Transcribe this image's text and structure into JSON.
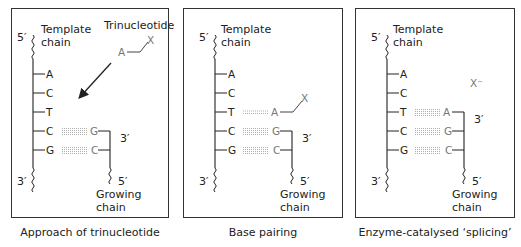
{
  "figure": {
    "panels": [
      {
        "id": "approach",
        "caption": "Approach of trinucleotide",
        "template_label_line1": "Template",
        "template_label_line2": "chain",
        "template_5prime": "5′",
        "template_3prime": "3′",
        "template_bases": [
          "A",
          "C",
          "T",
          "C",
          "G"
        ],
        "growing_bases": [
          "G",
          "C"
        ],
        "growing_3prime": "3′",
        "growing_5prime": "5′",
        "growing_label_line1": "Growing",
        "growing_label_line2": "chain",
        "trinucleotide_label": "Trinucleotide",
        "incoming_base": "A",
        "incoming_group": "X"
      },
      {
        "id": "base-pairing",
        "caption": "Base pairing",
        "template_label_line1": "Template",
        "template_label_line2": "chain",
        "template_5prime": "5′",
        "template_3prime": "3′",
        "template_bases": [
          "A",
          "C",
          "T",
          "C",
          "G"
        ],
        "growing_bases": [
          "A",
          "G",
          "C"
        ],
        "growing_3prime": "3′",
        "growing_5prime": "5′",
        "growing_label_line1": "Growing",
        "growing_label_line2": "chain",
        "incoming_group": "X"
      },
      {
        "id": "splicing",
        "caption": "Enzyme-catalysed ‘splicing’",
        "template_label_line1": "Template",
        "template_label_line2": "chain",
        "template_5prime": "5′",
        "template_3prime": "3′",
        "template_bases": [
          "A",
          "C",
          "T",
          "C",
          "G"
        ],
        "growing_bases": [
          "A",
          "G",
          "C"
        ],
        "growing_3prime": "3′",
        "growing_5prime": "5′",
        "growing_label_line1": "Growing",
        "growing_label_line2": "chain",
        "released_group": "X⁻"
      }
    ],
    "colors": {
      "line": "#222222",
      "growing_text": "#777777",
      "hbond": "#999999",
      "border": "#333333"
    }
  }
}
